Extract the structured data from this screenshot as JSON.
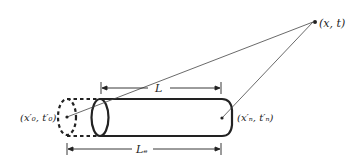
{
  "diagram": {
    "labels": {
      "point_xt": "(x, t)",
      "point_left": "(x′₀, t′₀)",
      "point_right": "(x′ₙ, t′ₙ)",
      "length_L": "L",
      "length_Le": "Lₑ"
    },
    "colors": {
      "stroke": "#222222",
      "background": "#ffffff"
    }
  }
}
